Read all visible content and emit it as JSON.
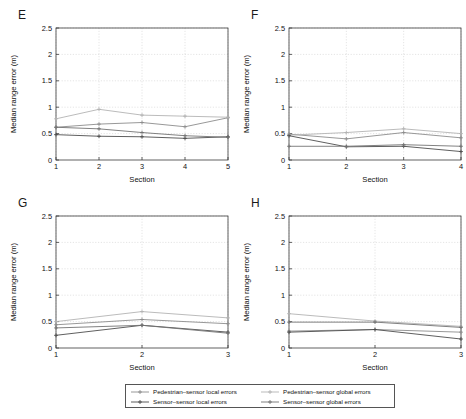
{
  "figure": {
    "axis": {
      "ylabel": "Median range error (m)",
      "xlabel": "Section",
      "yticks": [
        "0",
        "0.5",
        "1",
        "1.5",
        "2",
        "2.5"
      ],
      "ylim": [
        0,
        2.5
      ]
    },
    "legend": {
      "entries": [
        {
          "label": "Pedestrian–sensor local errors",
          "color": "#8c8c8c",
          "marker": "plus"
        },
        {
          "label": "Pedestrian–sensor global errors",
          "color": "#b3b3b3",
          "marker": "plus"
        },
        {
          "label": "Sensor–sensor local errors",
          "color": "#4d4d4d",
          "marker": "plus"
        },
        {
          "label": "Sensor–sensor global errors",
          "color": "#737373",
          "marker": "plus"
        }
      ]
    }
  },
  "chart_data": [
    {
      "type": "line",
      "panel": "E",
      "title": "E",
      "xlabel": "Section",
      "ylabel": "Median range error (m)",
      "categories": [
        "1",
        "2",
        "3",
        "4",
        "5"
      ],
      "x": [
        1,
        2,
        3,
        4,
        5
      ],
      "xlim": [
        1,
        5
      ],
      "ylim": [
        0,
        2.5
      ],
      "yticks": [
        0,
        0.5,
        1,
        1.5,
        2,
        2.5
      ],
      "grid": true,
      "legend_position": "below-figure",
      "series": [
        {
          "name": "Pedestrian–sensor local errors",
          "color": "#8c8c8c",
          "values": [
            0.62,
            0.68,
            0.71,
            0.63,
            0.8
          ]
        },
        {
          "name": "Pedestrian–sensor global errors",
          "color": "#b3b3b3",
          "values": [
            0.78,
            0.96,
            0.85,
            0.83,
            0.81
          ]
        },
        {
          "name": "Sensor–sensor local errors",
          "color": "#4d4d4d",
          "values": [
            0.48,
            0.45,
            0.44,
            0.41,
            0.44
          ]
        },
        {
          "name": "Sensor–sensor global errors",
          "color": "#737373",
          "values": [
            0.62,
            0.59,
            0.52,
            0.46,
            0.43
          ]
        }
      ]
    },
    {
      "type": "line",
      "panel": "F",
      "title": "F",
      "xlabel": "Section",
      "ylabel": "Median range error (m)",
      "categories": [
        "1",
        "2",
        "3",
        "4"
      ],
      "x": [
        1,
        2,
        3,
        4
      ],
      "xlim": [
        1,
        4
      ],
      "ylim": [
        0,
        2.5
      ],
      "yticks": [
        0,
        0.5,
        1,
        1.5,
        2,
        2.5
      ],
      "grid": true,
      "legend_position": "below-figure",
      "series": [
        {
          "name": "Pedestrian–sensor local errors",
          "color": "#8c8c8c",
          "values": [
            0.49,
            0.4,
            0.52,
            0.42
          ]
        },
        {
          "name": "Pedestrian–sensor global errors",
          "color": "#b3b3b3",
          "values": [
            0.47,
            0.52,
            0.59,
            0.5
          ]
        },
        {
          "name": "Sensor–sensor local errors",
          "color": "#4d4d4d",
          "values": [
            0.46,
            0.25,
            0.26,
            0.16
          ]
        },
        {
          "name": "Sensor–sensor global errors",
          "color": "#737373",
          "values": [
            0.26,
            0.26,
            0.29,
            0.26
          ]
        }
      ]
    },
    {
      "type": "line",
      "panel": "G",
      "title": "G",
      "xlabel": "Section",
      "ylabel": "Median range error (m)",
      "categories": [
        "1",
        "2",
        "3"
      ],
      "x": [
        1,
        2,
        3
      ],
      "xlim": [
        1,
        3
      ],
      "ylim": [
        0,
        2.5
      ],
      "yticks": [
        0,
        0.5,
        1,
        1.5,
        2,
        2.5
      ],
      "grid": true,
      "legend_position": "below-figure",
      "series": [
        {
          "name": "Pedestrian–sensor local errors",
          "color": "#8c8c8c",
          "values": [
            0.44,
            0.54,
            0.46
          ]
        },
        {
          "name": "Pedestrian–sensor global errors",
          "color": "#b3b3b3",
          "values": [
            0.5,
            0.69,
            0.57
          ]
        },
        {
          "name": "Sensor–sensor local errors",
          "color": "#4d4d4d",
          "values": [
            0.24,
            0.43,
            0.3
          ]
        },
        {
          "name": "Sensor–sensor global errors",
          "color": "#737373",
          "values": [
            0.38,
            0.43,
            0.28
          ]
        }
      ]
    },
    {
      "type": "line",
      "panel": "H",
      "title": "H",
      "xlabel": "Section",
      "ylabel": "Median range error (m)",
      "categories": [
        "1",
        "2",
        "3"
      ],
      "x": [
        1,
        2,
        3
      ],
      "xlim": [
        1,
        3
      ],
      "ylim": [
        0,
        2.5
      ],
      "yticks": [
        0,
        0.5,
        1,
        1.5,
        2,
        2.5
      ],
      "grid": true,
      "legend_position": "below-figure",
      "series": [
        {
          "name": "Pedestrian–sensor local errors",
          "color": "#8c8c8c",
          "values": [
            0.32,
            0.35,
            0.3
          ]
        },
        {
          "name": "Pedestrian–sensor global errors",
          "color": "#b3b3b3",
          "values": [
            0.65,
            0.51,
            0.41
          ]
        },
        {
          "name": "Sensor–sensor local errors",
          "color": "#4d4d4d",
          "values": [
            0.3,
            0.35,
            0.17
          ]
        },
        {
          "name": "Sensor–sensor global errors",
          "color": "#737373",
          "values": [
            0.49,
            0.49,
            0.39
          ]
        }
      ]
    }
  ]
}
